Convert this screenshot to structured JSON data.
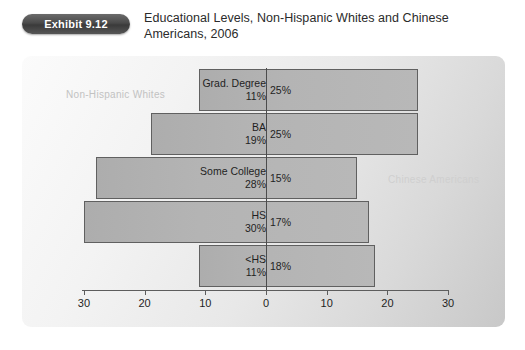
{
  "header": {
    "badge_label": "Exhibit 9.12",
    "title": "Educational Levels, Non-Hispanic Whites and Chinese Americans, 2006"
  },
  "legend": {
    "left_label": "Non-Hispanic Whites",
    "right_label": "Chinese Americans"
  },
  "axis": {
    "ticks": [
      {
        "label": "30"
      },
      {
        "label": "20"
      },
      {
        "label": "10"
      },
      {
        "label": "0"
      },
      {
        "label": "10"
      },
      {
        "label": "20"
      },
      {
        "label": "30"
      }
    ]
  },
  "rows": [
    {
      "category": "Grad. Degree",
      "left_value_label": "11%",
      "right_value_label": "25%"
    },
    {
      "category": "BA",
      "left_value_label": "19%",
      "right_value_label": "25%"
    },
    {
      "category": "Some College",
      "left_value_label": "28%",
      "right_value_label": "15%"
    },
    {
      "category": "HS",
      "left_value_label": "30%",
      "right_value_label": "17%"
    },
    {
      "category": "<HS",
      "left_value_label": "11%",
      "right_value_label": "18%"
    }
  ],
  "colors": {
    "bar_fill": "#b4b4b4",
    "bar_stroke": "#606060",
    "badge": "#4a4a4a",
    "legend_text": "#c2c2c2"
  },
  "chart_data": {
    "type": "bar",
    "title": "Educational Levels, Non-Hispanic Whites and Chinese Americans, 2006",
    "orientation": "horizontal",
    "style": "population-pyramid",
    "categories": [
      "Grad. Degree",
      "BA",
      "Some College",
      "HS",
      "<HS"
    ],
    "series": [
      {
        "name": "Non-Hispanic Whites",
        "side": "left",
        "values": [
          11,
          19,
          28,
          30,
          11
        ]
      },
      {
        "name": "Chinese Americans",
        "side": "right",
        "values": [
          25,
          25,
          15,
          17,
          18
        ]
      }
    ],
    "xlabel": "",
    "ylabel": "",
    "xlim": [
      -30,
      30
    ],
    "xticks": [
      30,
      20,
      10,
      0,
      10,
      20,
      30
    ],
    "units": "percent",
    "grid": false,
    "legend_position": "in-plot"
  }
}
